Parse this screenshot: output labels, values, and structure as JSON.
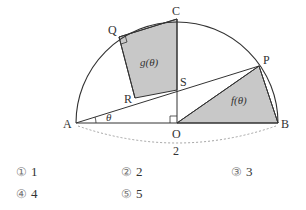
{
  "figure": {
    "points": {
      "A": "A",
      "B": "B",
      "C": "C",
      "O": "O",
      "P": "P",
      "Q": "Q",
      "R": "R",
      "S": "S"
    },
    "angle_label": "θ",
    "regions": {
      "f": "f(θ)",
      "g": "g(θ)"
    },
    "diameter_label": "2",
    "colors": {
      "shade": "#c8c8c8",
      "line": "#333333",
      "dashed": "#999999"
    }
  },
  "choices": [
    {
      "mark": "①",
      "value": "1"
    },
    {
      "mark": "②",
      "value": "2"
    },
    {
      "mark": "③",
      "value": "3"
    },
    {
      "mark": "④",
      "value": "4"
    },
    {
      "mark": "⑤",
      "value": "5"
    }
  ]
}
